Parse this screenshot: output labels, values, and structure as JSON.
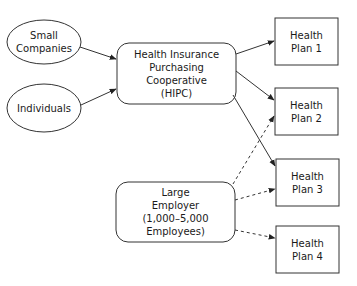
{
  "diagram": {
    "type": "flow",
    "nodes": [
      {
        "id": "small_companies",
        "shape": "ellipse",
        "lines": [
          "Small",
          "Companies"
        ]
      },
      {
        "id": "individuals",
        "shape": "ellipse",
        "lines": [
          "Individuals"
        ]
      },
      {
        "id": "hipc",
        "shape": "rounded-rect",
        "lines": [
          "Health Insurance",
          "Purchasing",
          "Cooperative",
          "(HIPC)"
        ]
      },
      {
        "id": "large_employer",
        "shape": "rounded-rect",
        "lines": [
          "Large",
          "Employer",
          "(1,000–5,000",
          "Employees)"
        ]
      },
      {
        "id": "plan1",
        "shape": "rect",
        "lines": [
          "Health",
          "Plan 1"
        ]
      },
      {
        "id": "plan2",
        "shape": "rect",
        "lines": [
          "Health",
          "Plan 2"
        ]
      },
      {
        "id": "plan3",
        "shape": "rect",
        "lines": [
          "Health",
          "Plan 3"
        ]
      },
      {
        "id": "plan4",
        "shape": "rect",
        "lines": [
          "Health",
          "Plan 4"
        ]
      }
    ],
    "edges": [
      {
        "from": "small_companies",
        "to": "hipc",
        "style": "solid"
      },
      {
        "from": "individuals",
        "to": "hipc",
        "style": "solid"
      },
      {
        "from": "hipc",
        "to": "plan1",
        "style": "solid"
      },
      {
        "from": "hipc",
        "to": "plan2",
        "style": "solid"
      },
      {
        "from": "hipc",
        "to": "plan3",
        "style": "solid"
      },
      {
        "from": "large_employer",
        "to": "plan2",
        "style": "dashed"
      },
      {
        "from": "large_employer",
        "to": "plan3",
        "style": "dashed"
      },
      {
        "from": "large_employer",
        "to": "plan4",
        "style": "dashed"
      }
    ],
    "colors": {
      "stroke": "#333333",
      "background": "#ffffff"
    }
  }
}
